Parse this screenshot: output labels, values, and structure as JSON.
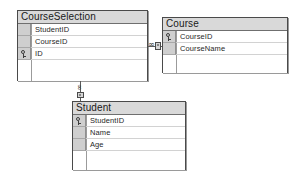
{
  "diagram": {
    "type": "entity-relationship-diagram",
    "background_color": "#ffffff",
    "border_color": "#4a4a4a",
    "header_fill": "#d9d9d9",
    "gutter_fill": "#cfcfcf"
  },
  "entities": [
    {
      "id": "course-selection",
      "title": "CourseSelection",
      "x": 17,
      "y": 10,
      "width": 131,
      "height": 71,
      "fields": [
        {
          "name": "StudentID",
          "key": false
        },
        {
          "name": "CourseID",
          "key": false
        },
        {
          "name": "ID",
          "key": true
        }
      ]
    },
    {
      "id": "course",
      "title": "Course",
      "x": 162,
      "y": 17,
      "width": 126,
      "height": 56,
      "fields": [
        {
          "name": "CourseID",
          "key": true
        },
        {
          "name": "CourseName",
          "key": false
        }
      ]
    },
    {
      "id": "student",
      "title": "Student",
      "x": 72,
      "y": 101,
      "width": 114,
      "height": 69,
      "fields": [
        {
          "name": "StudentID",
          "key": true
        },
        {
          "name": "Name",
          "key": false
        },
        {
          "name": "Age",
          "key": false
        }
      ]
    }
  ],
  "relationships": [
    {
      "id": "courseselection-course",
      "from": "course-selection",
      "to": "course",
      "from_cardinality": "many",
      "to_cardinality": "one",
      "orientation": "horizontal",
      "many_glyph": "∞",
      "one_glyph": "key"
    },
    {
      "id": "courseselection-student",
      "from": "course-selection",
      "to": "student",
      "from_cardinality": "many",
      "to_cardinality": "one",
      "orientation": "vertical",
      "many_glyph": "∞",
      "one_glyph": "key"
    }
  ]
}
